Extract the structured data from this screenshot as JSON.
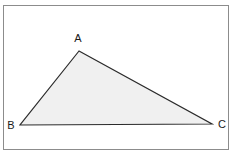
{
  "figure": {
    "kind": "geometry-diagram",
    "shape_name": "triangle",
    "background_color": "#ffffff",
    "frame": {
      "border_color": "#8c8c8c",
      "x": 3,
      "y": 5,
      "width": 226,
      "height": 145
    },
    "triangle": {
      "fill_color": "#f0f0f0",
      "stroke_color": "#2b2b2b",
      "stroke_width": 1.2,
      "points": "79,51 20,125 212,124",
      "vertices": [
        {
          "id": "A",
          "label": "A",
          "x": 79,
          "y": 51,
          "label_x": 78,
          "label_y": 42
        },
        {
          "id": "B",
          "label": "B",
          "x": 20,
          "y": 125,
          "label_x": 11,
          "label_y": 125
        },
        {
          "id": "C",
          "label": "C",
          "x": 212,
          "y": 124,
          "label_x": 222,
          "label_y": 124
        }
      ]
    }
  }
}
